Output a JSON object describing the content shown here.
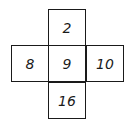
{
  "cross_grid": {
    "top": "2",
    "left": "8",
    "center": "9",
    "right": "10",
    "bottom": "16"
  }
}
